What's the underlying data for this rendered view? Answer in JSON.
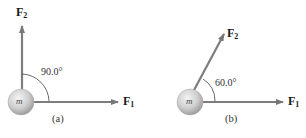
{
  "panels": [
    {
      "id": "a",
      "caption": "(a)",
      "mass_label": "m",
      "force1": {
        "symbol": "F",
        "subscript": "1"
      },
      "force2": {
        "symbol": "F",
        "subscript": "2"
      },
      "angle_label": "90.0°",
      "angle_deg": 90
    },
    {
      "id": "b",
      "caption": "(b)",
      "mass_label": "m",
      "force1": {
        "symbol": "F",
        "subscript": "1"
      },
      "force2": {
        "symbol": "F",
        "subscript": "2"
      },
      "angle_label": "60.0°",
      "angle_deg": 60
    }
  ],
  "colors": {
    "arrow": "#7a7a7a",
    "ball_light": "#eeeeee",
    "ball_dark": "#a8a8a8",
    "text": "#1a1a1a"
  }
}
